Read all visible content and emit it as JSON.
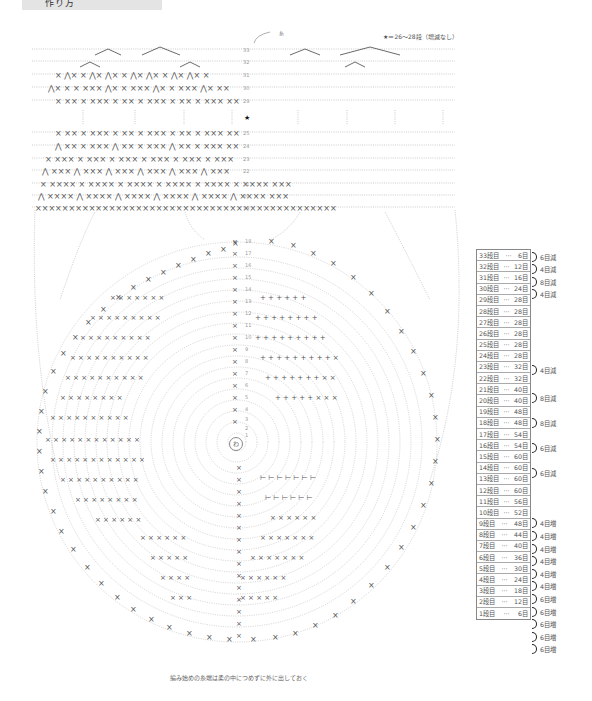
{
  "header": {
    "title": "作り方"
  },
  "legend": {
    "note": "★＝26〜28段（増減なし）",
    "yarn_label": "糸",
    "star": "★"
  },
  "center_label": "わ",
  "footnote": "編み始めの糸端は柔の中につめずに外に出しておく",
  "top_chart": {
    "row_numbers": [
      "33",
      "32",
      "31",
      "30",
      "29",
      "25",
      "24",
      "23",
      "22",
      "21",
      "20",
      "19"
    ]
  },
  "round_chart": {
    "row_numbers": [
      "18",
      "17",
      "16",
      "15",
      "14",
      "13",
      "12",
      "11",
      "10",
      "9",
      "8",
      "7",
      "6",
      "5",
      "4",
      "3",
      "2",
      "1"
    ]
  },
  "stitch_table": [
    {
      "row": "33段目",
      "count": "6目"
    },
    {
      "row": "32段目",
      "count": "12目"
    },
    {
      "row": "31段目",
      "count": "16目"
    },
    {
      "row": "30段目",
      "count": "24目"
    },
    {
      "row": "29段目",
      "count": "28目"
    },
    {
      "row": "28段目",
      "count": "28目"
    },
    {
      "row": "27段目",
      "count": "28目"
    },
    {
      "row": "26段目",
      "count": "28目"
    },
    {
      "row": "25段目",
      "count": "28目"
    },
    {
      "row": "24段目",
      "count": "28目"
    },
    {
      "row": "23段目",
      "count": "32目"
    },
    {
      "row": "22段目",
      "count": "32目"
    },
    {
      "row": "21段目",
      "count": "40目"
    },
    {
      "row": "20段目",
      "count": "40目"
    },
    {
      "row": "19段目",
      "count": "48目"
    },
    {
      "row": "18段目",
      "count": "48目"
    },
    {
      "row": "17段目",
      "count": "54目"
    },
    {
      "row": "16段目",
      "count": "54目"
    },
    {
      "row": "15段目",
      "count": "60目"
    },
    {
      "row": "14段目",
      "count": "60目"
    },
    {
      "row": "13段目",
      "count": "60目"
    },
    {
      "row": "12段目",
      "count": "60目"
    },
    {
      "row": "11段目",
      "count": "56目"
    },
    {
      "row": "10段目",
      "count": "52目"
    },
    {
      "row": "9段目",
      "count": "48目"
    },
    {
      "row": "8段目",
      "count": "44目"
    },
    {
      "row": "7段目",
      "count": "40目"
    },
    {
      "row": "6段目",
      "count": "36目"
    },
    {
      "row": "5段目",
      "count": "30目"
    },
    {
      "row": "4段目",
      "count": "24目"
    },
    {
      "row": "3段目",
      "count": "18目"
    },
    {
      "row": "2段目",
      "count": "12目"
    },
    {
      "row": "1段目",
      "count": "6目"
    }
  ],
  "annotations": [
    {
      "label": "6目減",
      "top": 252
    },
    {
      "label": "4目減",
      "top": 264
    },
    {
      "label": "8目減",
      "top": 277
    },
    {
      "label": "4目減",
      "top": 289
    },
    {
      "label": "4目減",
      "top": 365
    },
    {
      "label": "8目減",
      "top": 393
    },
    {
      "label": "8目減",
      "top": 418
    },
    {
      "label": "6目減",
      "top": 443
    },
    {
      "label": "6目減",
      "top": 468
    },
    {
      "label": "4目増",
      "top": 518
    },
    {
      "label": "4目増",
      "top": 531
    },
    {
      "label": "4目増",
      "top": 544
    },
    {
      "label": "4目増",
      "top": 556
    },
    {
      "label": "4目増",
      "top": 569
    },
    {
      "label": "4目増",
      "top": 581
    },
    {
      "label": "6目増",
      "top": 594
    },
    {
      "label": "6目増",
      "top": 607
    },
    {
      "label": "6目増",
      "top": 619
    },
    {
      "label": "6目増",
      "top": 632
    },
    {
      "label": "6目増",
      "top": 644
    }
  ]
}
